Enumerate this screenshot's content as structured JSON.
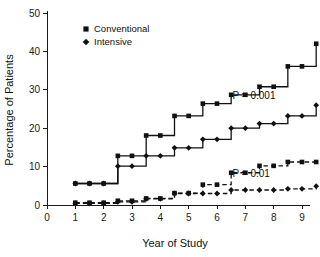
{
  "chart_data": {
    "type": "line",
    "title": "",
    "xlabel": "Year of Study",
    "ylabel": "Percentage of Patients",
    "xlim": [
      0,
      9.6
    ],
    "ylim": [
      0,
      50
    ],
    "xticks": [
      "0",
      "1",
      "2",
      "3",
      "4",
      "5",
      "6",
      "7",
      "8",
      "9"
    ],
    "yticks": [
      "0",
      "10",
      "20",
      "30",
      "40",
      "50"
    ],
    "grid": false,
    "legend_position": "top-left-inside",
    "step_style": "post",
    "legend": [
      {
        "label": "Conventional",
        "marker": "square"
      },
      {
        "label": "Intensive",
        "marker": "diamond"
      }
    ],
    "annotations": [
      {
        "text": "P = 0.001",
        "x": 6.55,
        "y": 27.5
      },
      {
        "text": "P = 0.01",
        "x": 6.55,
        "y": 7.2
      }
    ],
    "series": [
      {
        "name": "Conventional (upper solid)",
        "marker": "square",
        "line_style": "solid",
        "x": [
          1,
          1.5,
          2,
          2.5,
          3,
          3.5,
          4,
          4.5,
          5,
          5.5,
          6,
          6.5,
          7,
          7.5,
          8,
          8.5,
          9,
          9.5
        ],
        "values": [
          5.6,
          5.6,
          5.6,
          12.8,
          12.8,
          18.1,
          18.1,
          23.2,
          23.2,
          26.4,
          26.4,
          28.7,
          28.7,
          30.8,
          30.8,
          36.1,
          36.1,
          42.0
        ]
      },
      {
        "name": "Conventional (lower solid)",
        "marker": "diamond",
        "line_style": "solid",
        "x": [
          1,
          1.5,
          2,
          2.5,
          3,
          3.5,
          4,
          4.5,
          5,
          5.5,
          6,
          6.5,
          7,
          7.5,
          8,
          8.5,
          9,
          9.5
        ],
        "values": [
          5.6,
          5.6,
          5.6,
          10.1,
          10.1,
          12.8,
          12.8,
          14.9,
          14.9,
          17.1,
          17.1,
          20.0,
          20.0,
          21.2,
          21.2,
          23.2,
          23.2,
          26.0
        ]
      },
      {
        "name": "Intensive (upper dashed)",
        "marker": "square",
        "line_style": "dashed",
        "x": [
          1,
          1.5,
          2,
          2.5,
          3,
          3.5,
          4,
          4.5,
          5,
          5.5,
          6,
          6.5,
          7,
          7.5,
          8,
          8.5,
          9,
          9.5
        ],
        "values": [
          0.6,
          0.6,
          0.6,
          1.1,
          1.1,
          1.7,
          1.7,
          3.1,
          3.1,
          5.3,
          5.3,
          8.4,
          8.4,
          10.2,
          10.2,
          11.2,
          11.2,
          11.2
        ]
      },
      {
        "name": "Intensive (lower dashed)",
        "marker": "diamond",
        "line_style": "dashed",
        "x": [
          1,
          1.5,
          2,
          2.5,
          3,
          3.5,
          4,
          4.5,
          5,
          5.5,
          6,
          6.5,
          7,
          7.5,
          8,
          8.5,
          9,
          9.5
        ],
        "values": [
          0.4,
          0.4,
          0.4,
          0.8,
          0.8,
          1.6,
          1.6,
          3.0,
          3.0,
          3.0,
          3.0,
          3.9,
          3.9,
          3.9,
          3.9,
          4.2,
          4.2,
          4.9
        ]
      }
    ]
  }
}
